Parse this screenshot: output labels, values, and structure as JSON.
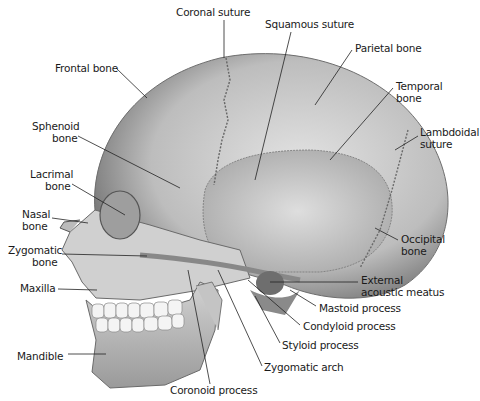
{
  "diagram": {
    "labels": [
      {
        "id": "coronal-suture",
        "text": "Coronal suture",
        "x": 176,
        "y": 6,
        "align": "left"
      },
      {
        "id": "squamous-suture",
        "text": "Squamous suture",
        "x": 265,
        "y": 18,
        "align": "left"
      },
      {
        "id": "parietal-bone",
        "text": "Parietal bone",
        "x": 355,
        "y": 42,
        "align": "left"
      },
      {
        "id": "frontal-bone",
        "text": "Frontal bone",
        "x": 55,
        "y": 62,
        "align": "left"
      },
      {
        "id": "temporal-bone-1",
        "text": "Temporal",
        "x": 396,
        "y": 80,
        "align": "left"
      },
      {
        "id": "temporal-bone-2",
        "text": "bone",
        "x": 396,
        "y": 92,
        "align": "left"
      },
      {
        "id": "sphenoid-bone-1",
        "text": "Sphenoid",
        "x": 32,
        "y": 120,
        "align": "left"
      },
      {
        "id": "sphenoid-bone-2",
        "text": "bone",
        "x": 52,
        "y": 132,
        "align": "left"
      },
      {
        "id": "lambdoidal-suture-1",
        "text": "Lambdoidal",
        "x": 420,
        "y": 126,
        "align": "left"
      },
      {
        "id": "lambdoidal-suture-2",
        "text": "suture",
        "x": 420,
        "y": 138,
        "align": "left"
      },
      {
        "id": "lacrimal-bone-1",
        "text": "Lacrimal",
        "x": 30,
        "y": 168,
        "align": "left"
      },
      {
        "id": "lacrimal-bone-2",
        "text": "bone",
        "x": 45,
        "y": 180,
        "align": "left"
      },
      {
        "id": "nasal-bone-1",
        "text": "Nasal",
        "x": 22,
        "y": 208,
        "align": "left"
      },
      {
        "id": "nasal-bone-2",
        "text": "bone",
        "x": 22,
        "y": 220,
        "align": "left"
      },
      {
        "id": "occipital-bone-1",
        "text": "Occipital",
        "x": 401,
        "y": 233,
        "align": "left"
      },
      {
        "id": "occipital-bone-2",
        "text": "bone",
        "x": 401,
        "y": 245,
        "align": "left"
      },
      {
        "id": "zygomatic-bone-1",
        "text": "Zygomatic",
        "x": 8,
        "y": 244,
        "align": "left"
      },
      {
        "id": "zygomatic-bone-2",
        "text": "bone",
        "x": 32,
        "y": 256,
        "align": "left"
      },
      {
        "id": "external-acoustic-meatus-1",
        "text": "External",
        "x": 361,
        "y": 274,
        "align": "left"
      },
      {
        "id": "external-acoustic-meatus-2",
        "text": "acoustic meatus",
        "x": 361,
        "y": 286,
        "align": "left"
      },
      {
        "id": "maxilla",
        "text": "Maxilla",
        "x": 20,
        "y": 282,
        "align": "left"
      },
      {
        "id": "mastoid-process",
        "text": "Mastoid process",
        "x": 319,
        "y": 302,
        "align": "left"
      },
      {
        "id": "condyloid-process",
        "text": "Condyloid process",
        "x": 303,
        "y": 320,
        "align": "left"
      },
      {
        "id": "styloid-process",
        "text": "Styloid process",
        "x": 282,
        "y": 339,
        "align": "left"
      },
      {
        "id": "mandible",
        "text": "Mandible",
        "x": 17,
        "y": 350,
        "align": "left"
      },
      {
        "id": "zygomatic-arch",
        "text": "Zygomatic arch",
        "x": 264,
        "y": 361,
        "align": "left"
      },
      {
        "id": "coronoid-process",
        "text": "Coronoid process",
        "x": 170,
        "y": 384,
        "align": "left"
      }
    ],
    "colors": {
      "bone": "#c9c9c9",
      "bone_dark": "#8a8a8a",
      "bone_light": "#e6e6e6",
      "line": "#222222",
      "text": "#1a1a1a"
    }
  }
}
